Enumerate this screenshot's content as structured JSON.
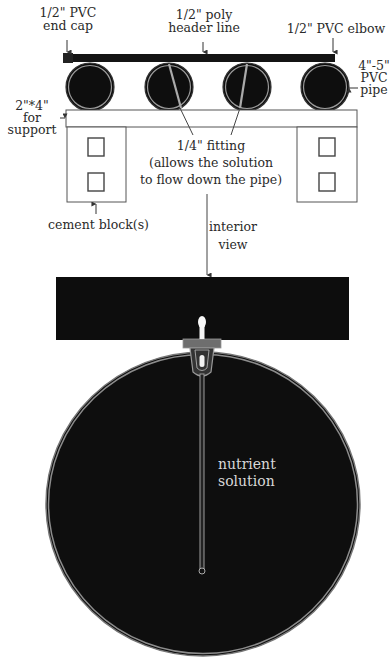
{
  "diagram": {
    "top_view": {
      "labels": {
        "end_cap": [
          "1/2\" PVC",
          "end cap"
        ],
        "header_line": [
          "1/2\" poly",
          "header line"
        ],
        "elbow": "1/2\" PVC elbow",
        "pipe": [
          "4\"-5\"",
          "PVC",
          "pipe"
        ],
        "support": [
          "2\"*4\"",
          "for",
          "support"
        ],
        "fitting": [
          "1/4\" fitting",
          "(allows the solution",
          "to flow down the pipe)"
        ],
        "cement_block": "cement block(s)",
        "interior_view": [
          "interior",
          "view"
        ]
      },
      "pipe_count": 4
    },
    "interior_view": {
      "label": [
        "nutrient",
        "solution"
      ]
    },
    "colors": {
      "pipe_fill": "#0e0e0e",
      "pipe_rim": "#9a9a9a",
      "outline": "#444444",
      "background": "#ffffff"
    }
  }
}
